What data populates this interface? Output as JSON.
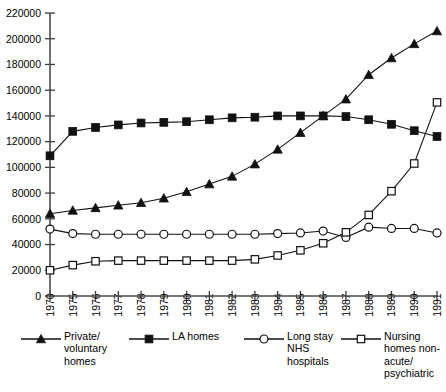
{
  "chart_data": {
    "type": "line",
    "title": "",
    "subtitle": "",
    "xlabel": "",
    "ylabel": "",
    "grid": false,
    "legend_position": "bottom",
    "ylim": [
      0,
      220000
    ],
    "ytick_labels": [
      "0",
      "20000",
      "40000",
      "60000",
      "80000",
      "100000",
      "120000",
      "140000",
      "160000",
      "180000",
      "200000",
      "220000"
    ],
    "ytick_values": [
      0,
      20000,
      40000,
      60000,
      80000,
      100000,
      120000,
      140000,
      160000,
      180000,
      200000,
      220000
    ],
    "categories": [
      "1970",
      "1975",
      "1976",
      "1977",
      "1978",
      "1979",
      "1980",
      "1981",
      "1982",
      "1983",
      "1984",
      "1985",
      "1986",
      "1987",
      "1988",
      "1989",
      "1990",
      "1991"
    ],
    "series": [
      {
        "name": "Private/\nvoluntary\nhomes",
        "marker": "filled-triangle",
        "color": "#111111",
        "values": [
          64000,
          66500,
          68500,
          70500,
          72500,
          76000,
          81000,
          87000,
          93000,
          102500,
          114000,
          127000,
          140000,
          153000,
          172000,
          185000,
          196000,
          206000
        ]
      },
      {
        "name": "LA homes",
        "marker": "filled-square",
        "color": "#111111",
        "values": [
          109000,
          128000,
          131000,
          133000,
          134500,
          135000,
          135500,
          137000,
          138500,
          139000,
          140000,
          140000,
          140000,
          139500,
          137000,
          133500,
          128500,
          124000
        ]
      },
      {
        "name": "Long stay\nNHS\nhospitals",
        "marker": "open-circle",
        "color": "#111111",
        "values": [
          52000,
          48500,
          48000,
          48000,
          48000,
          48000,
          48000,
          48000,
          48000,
          48000,
          48500,
          49000,
          50500,
          45500,
          53500,
          52500,
          52500,
          49000
        ]
      },
      {
        "name": "Nursing\nhomes non-\nacute/\npsychiatric",
        "marker": "open-square",
        "color": "#111111",
        "values": [
          20000,
          24000,
          27000,
          27500,
          27500,
          27500,
          27500,
          27500,
          27500,
          28500,
          31500,
          35500,
          41000,
          49500,
          63000,
          81500,
          103000,
          150500
        ]
      }
    ]
  },
  "legend": {
    "entries": [
      {
        "label": "Private/\nvoluntary\nhomes",
        "marker": "filled-triangle"
      },
      {
        "label": "LA homes",
        "marker": "filled-square"
      },
      {
        "label": "Long stay\nNHS\nhospitals",
        "marker": "open-circle"
      },
      {
        "label": "Nursing\nhomes non-\nacute/\npsychiatric",
        "marker": "open-square"
      }
    ]
  }
}
